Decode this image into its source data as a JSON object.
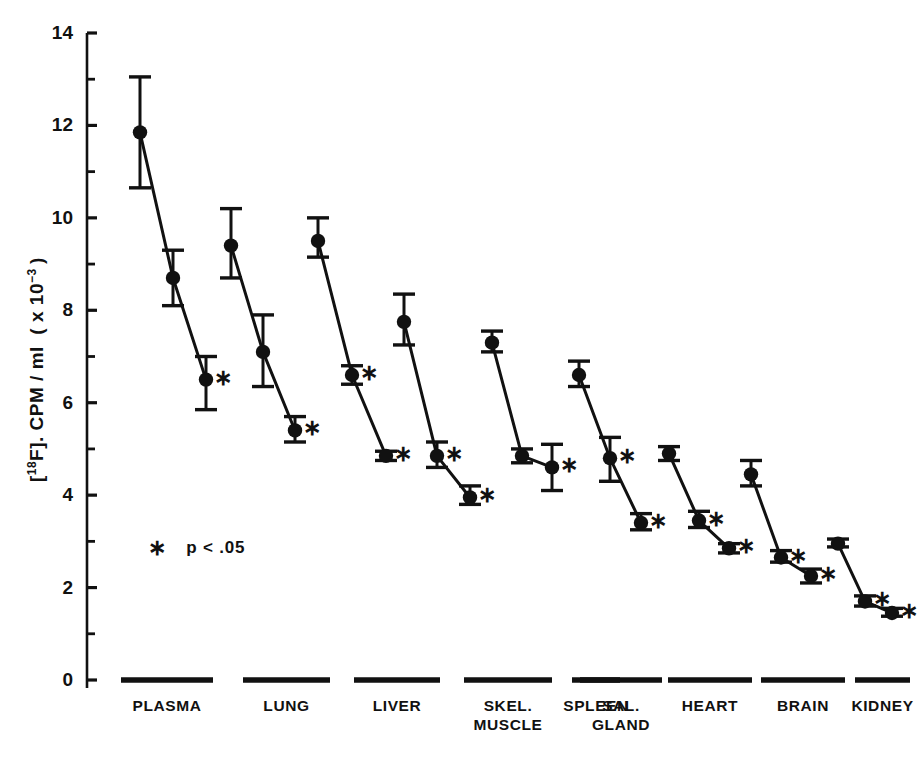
{
  "chart_data": {
    "type": "line",
    "title": "",
    "xlabel": "",
    "ylabel": "[18F]. CPM/ml (x 10-3)",
    "ylabel_parts": {
      "prefix": "[",
      "isotope_sup": "18",
      "element": "F]. CPM/ml  ( x 10",
      "exponent_sup": "-3",
      "suffix": " )"
    },
    "ylim": [
      0,
      14
    ],
    "yticks_major": [
      0,
      2,
      4,
      6,
      8,
      10,
      12,
      14
    ],
    "yticks_minor": [
      1,
      3,
      5,
      7,
      9,
      11,
      13
    ],
    "ytick_labels": [
      "0",
      "2",
      "4",
      "6",
      "8",
      "10",
      "12",
      "14"
    ],
    "grid": false,
    "legend_position": "inside-left",
    "annotation": "*  p < .05",
    "significance_marker": "*",
    "marker_style": "filled-circle",
    "error_bars": "vertical-capped",
    "categories": [
      "PLASMA",
      "LUNG",
      "LIVER",
      "SKEL.\nMUSCLE",
      "SPLEEN",
      "SAL.\nGLAND",
      "HEART",
      "BRAIN",
      "KIDNEY"
    ],
    "groups": [
      {
        "name": "PLASMA",
        "points": [
          {
            "index": 1,
            "value": 11.85,
            "err_low": 10.65,
            "err_high": 13.05,
            "significant": false
          },
          {
            "index": 2,
            "value": 8.7,
            "err_low": 8.1,
            "err_high": 9.3,
            "significant": false
          },
          {
            "index": 3,
            "value": 6.5,
            "err_low": 5.85,
            "err_high": 7.0,
            "significant": true
          }
        ]
      },
      {
        "name": "LUNG",
        "points": [
          {
            "index": 1,
            "value": 9.4,
            "err_low": 8.7,
            "err_high": 10.2,
            "significant": false
          },
          {
            "index": 2,
            "value": 7.1,
            "err_low": 6.35,
            "err_high": 7.9,
            "significant": false
          },
          {
            "index": 3,
            "value": 5.4,
            "err_low": 5.15,
            "err_high": 5.7,
            "significant": true
          }
        ]
      },
      {
        "name": "LIVER",
        "points": [
          {
            "index": 1,
            "value": 9.5,
            "err_low": 9.15,
            "err_high": 10.0,
            "significant": false
          },
          {
            "index": 2,
            "value": 6.6,
            "err_low": 6.4,
            "err_high": 6.8,
            "significant": true
          },
          {
            "index": 3,
            "value": 4.85,
            "err_low": 4.75,
            "err_high": 4.95,
            "significant": true
          }
        ]
      },
      {
        "name": "SKEL. MUSCLE",
        "points": [
          {
            "index": 1,
            "value": 7.75,
            "err_low": 7.25,
            "err_high": 8.35,
            "significant": false
          },
          {
            "index": 2,
            "value": 4.85,
            "err_low": 4.6,
            "err_high": 5.15,
            "significant": true
          },
          {
            "index": 3,
            "value": 3.95,
            "err_low": 3.8,
            "err_high": 4.2,
            "significant": true
          }
        ]
      },
      {
        "name": "SPLEEN",
        "points": [
          {
            "index": 1,
            "value": 7.3,
            "err_low": 7.1,
            "err_high": 7.55,
            "significant": false
          },
          {
            "index": 2,
            "value": 4.85,
            "err_low": 4.7,
            "err_high": 5.0,
            "significant": false
          },
          {
            "index": 3,
            "value": 4.6,
            "err_low": 4.1,
            "err_high": 5.1,
            "significant": true
          }
        ]
      },
      {
        "name": "SAL. GLAND",
        "points": [
          {
            "index": 1,
            "value": 6.6,
            "err_low": 6.35,
            "err_high": 6.9,
            "significant": false
          },
          {
            "index": 2,
            "value": 4.8,
            "err_low": 4.3,
            "err_high": 5.25,
            "significant": true
          },
          {
            "index": 3,
            "value": 3.4,
            "err_low": 3.25,
            "err_high": 3.6,
            "significant": true
          }
        ]
      },
      {
        "name": "HEART",
        "points": [
          {
            "index": 1,
            "value": 4.9,
            "err_low": 4.75,
            "err_high": 5.05,
            "significant": false
          },
          {
            "index": 2,
            "value": 3.45,
            "err_low": 3.3,
            "err_high": 3.65,
            "significant": true
          },
          {
            "index": 3,
            "value": 2.85,
            "err_low": 2.75,
            "err_high": 2.95,
            "significant": true
          }
        ]
      },
      {
        "name": "BRAIN",
        "points": [
          {
            "index": 1,
            "value": 4.45,
            "err_low": 4.2,
            "err_high": 4.75,
            "significant": false
          },
          {
            "index": 2,
            "value": 2.65,
            "err_low": 2.55,
            "err_high": 2.8,
            "significant": true
          },
          {
            "index": 3,
            "value": 2.25,
            "err_low": 2.1,
            "err_high": 2.4,
            "significant": true
          }
        ]
      },
      {
        "name": "KIDNEY",
        "points": [
          {
            "index": 1,
            "value": 2.95,
            "err_low": 2.88,
            "err_high": 3.05,
            "significant": false
          },
          {
            "index": 2,
            "value": 1.7,
            "err_low": 1.6,
            "err_high": 1.82,
            "significant": true
          },
          {
            "index": 3,
            "value": 1.45,
            "err_low": 1.38,
            "err_high": 1.55,
            "significant": true
          }
        ]
      }
    ]
  },
  "axis": {
    "y_tick_labels": [
      "14",
      "12",
      "10",
      "8",
      "6",
      "4",
      "2",
      "0"
    ]
  },
  "legend": {
    "note": "p < .05",
    "marker": "*"
  },
  "colors": {
    "ink": "#111111",
    "background": "#ffffff"
  }
}
